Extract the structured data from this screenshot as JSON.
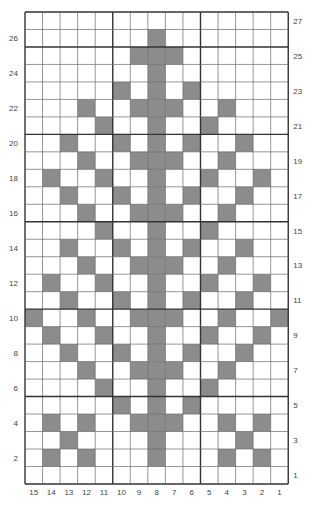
{
  "chart_data": {
    "type": "heatmap",
    "title": "",
    "columns": 15,
    "rows": 27,
    "column_labels": [
      "15",
      "14",
      "13",
      "12",
      "11",
      "10",
      "9",
      "8",
      "7",
      "6",
      "5",
      "4",
      "3",
      "2",
      "1"
    ],
    "row_labels_left": [
      "26",
      "24",
      "22",
      "20",
      "18",
      "16",
      "14",
      "12",
      "10",
      "8",
      "6",
      "4",
      "2"
    ],
    "row_labels_right": [
      "27",
      "25",
      "23",
      "21",
      "19",
      "17",
      "15",
      "13",
      "11",
      "9",
      "7",
      "5",
      "3",
      "1"
    ],
    "filled_color": "#8c8c8c",
    "empty_color": "#ffffff",
    "grid_color": "#6a6a6a",
    "major_grid_color": "#333333",
    "major_grid_every": 5,
    "filled_cells_by_row": {
      "27": [],
      "26": [
        7
      ],
      "25": [
        6,
        7,
        8
      ],
      "24": [
        7
      ],
      "23": [
        5,
        7,
        9
      ],
      "22": [
        3,
        6,
        7,
        8,
        11
      ],
      "21": [
        4,
        7,
        10
      ],
      "20": [
        2,
        5,
        7,
        9,
        12
      ],
      "19": [
        3,
        6,
        7,
        8,
        11
      ],
      "18": [
        1,
        4,
        7,
        10,
        13
      ],
      "17": [
        2,
        5,
        7,
        9,
        12
      ],
      "16": [
        3,
        6,
        7,
        8,
        11
      ],
      "15": [
        4,
        7,
        10
      ],
      "14": [
        2,
        5,
        7,
        9,
        12
      ],
      "13": [
        3,
        6,
        7,
        8,
        11
      ],
      "12": [
        1,
        4,
        7,
        10,
        13
      ],
      "11": [
        2,
        5,
        7,
        9,
        12
      ],
      "10": [
        0,
        3,
        6,
        7,
        8,
        11,
        14
      ],
      "9": [
        1,
        4,
        7,
        10,
        13
      ],
      "8": [
        2,
        5,
        7,
        9,
        12
      ],
      "7": [
        3,
        6,
        7,
        8,
        11
      ],
      "6": [
        4,
        7,
        10
      ],
      "5": [
        5,
        7,
        9
      ],
      "4": [
        1,
        3,
        6,
        7,
        8,
        11,
        13
      ],
      "3": [
        2,
        7,
        12
      ],
      "2": [
        1,
        3,
        7,
        11,
        13
      ],
      "1": []
    },
    "column_index_note": "filled cell indices are 0-based from the left edge (index 0 = column label 15)"
  }
}
